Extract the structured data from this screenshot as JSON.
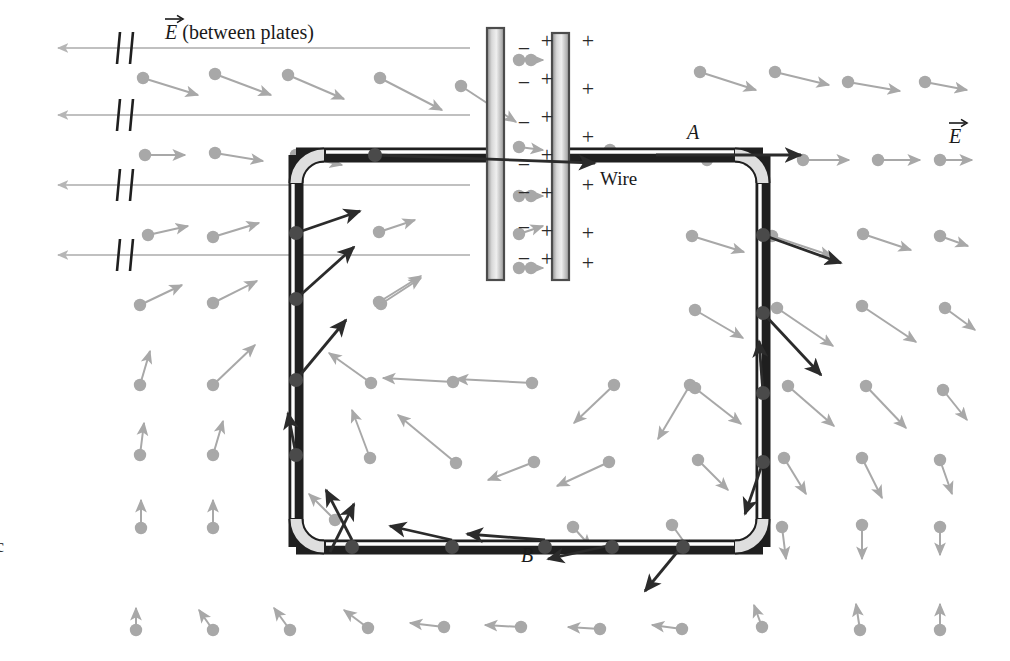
{
  "figure": {
    "domain": "physics-electrostatics-diagram",
    "title_label": "E (between plates)",
    "field_label_right": "E",
    "vector_symbol": "E",
    "labels": {
      "between_plates": "(between plates)",
      "point_a": "A",
      "point_b": "B",
      "wire": "Wire",
      "margin_char": "c"
    },
    "colors": {
      "field_gray": "#a8a8a8",
      "field_gray_light": "#c0c0c0",
      "force_dark": "#2b2b2b",
      "charge_dot": "#4a4a4a",
      "wire_outline": "#1f1f1f",
      "wire_fill_light": "#f2f2f2",
      "wire_fill_mid": "#c9c9c9",
      "plate_border": "#555555",
      "plate_fill_light": "#efefef",
      "plate_fill_dark": "#909090",
      "background": "#ffffff",
      "text": "#1a1a1a"
    },
    "plates": {
      "left": {
        "x": 487,
        "y": 28,
        "w": 17,
        "h": 252,
        "charge_symbol": "−",
        "charge_side": "right"
      },
      "right": {
        "x": 552,
        "y": 33,
        "w": 17,
        "h": 247,
        "charge_symbol": "+",
        "charge_side": "right"
      }
    },
    "minus_signs_x": 524,
    "minus_signs_y": [
      52,
      86,
      126,
      168,
      196,
      231,
      262
    ],
    "plus_inner_x": 547,
    "plus_inner_y": [
      44,
      82,
      120,
      158,
      196,
      234,
      262
    ],
    "plus_outer_x": 588,
    "plus_outer_y": [
      44,
      92,
      140,
      188,
      236,
      266
    ],
    "wire_loop": {
      "left_x": 296,
      "right_x": 763,
      "top_y": 155,
      "bottom_y": 547,
      "corner_radius": 28,
      "thickness": 13,
      "top_opening_x": 487
    },
    "wire_charges_top": [
      375
    ],
    "wire_charges_left_y": [
      233,
      299,
      380,
      455
    ],
    "wire_charges_right_y": [
      235,
      313,
      393,
      462
    ],
    "wire_charges_bottom_x": [
      352,
      452,
      545,
      612,
      683
    ],
    "field_break_lines_y": [
      48,
      115,
      185,
      255
    ],
    "break_mark_x": 120,
    "counts": {
      "background_field_vectors": 78,
      "charge_force_arrows": 16,
      "minus_signs": 7,
      "plus_signs_inner": 7,
      "plus_signs_outer": 6,
      "long_field_lines": 4
    }
  },
  "chart_data": {
    "type": "scatter",
    "xlabel": "",
    "ylabel": "",
    "background_vectors": [
      {
        "x": 143,
        "y": 78,
        "dx": 55,
        "dy": 17
      },
      {
        "x": 215,
        "y": 74,
        "dx": 56,
        "dy": 21
      },
      {
        "x": 288,
        "y": 75,
        "dx": 56,
        "dy": 24
      },
      {
        "x": 380,
        "y": 78,
        "dx": 62,
        "dy": 32
      },
      {
        "x": 461,
        "y": 86,
        "dx": 55,
        "dy": 36
      },
      {
        "x": 700,
        "y": 72,
        "dx": 56,
        "dy": 18
      },
      {
        "x": 775,
        "y": 72,
        "dx": 54,
        "dy": 13
      },
      {
        "x": 848,
        "y": 82,
        "dx": 52,
        "dy": 9
      },
      {
        "x": 925,
        "y": 82,
        "dx": 42,
        "dy": 8
      },
      {
        "x": 145,
        "y": 155,
        "dx": 40,
        "dy": 0
      },
      {
        "x": 215,
        "y": 153,
        "dx": 48,
        "dy": 8
      },
      {
        "x": 296,
        "y": 155,
        "dx": 46,
        "dy": 10
      },
      {
        "x": 519,
        "y": 147,
        "dx": 24,
        "dy": 3
      },
      {
        "x": 707,
        "y": 160,
        "dx": 50,
        "dy": 0
      },
      {
        "x": 803,
        "y": 160,
        "dx": 46,
        "dy": 0
      },
      {
        "x": 878,
        "y": 160,
        "dx": 42,
        "dy": 0
      },
      {
        "x": 940,
        "y": 160,
        "dx": 32,
        "dy": 0
      },
      {
        "x": 148,
        "y": 235,
        "dx": 40,
        "dy": -9
      },
      {
        "x": 213,
        "y": 237,
        "dx": 46,
        "dy": -14
      },
      {
        "x": 379,
        "y": 232,
        "dx": 36,
        "dy": -12
      },
      {
        "x": 519,
        "y": 234,
        "dx": 24,
        "dy": -8
      },
      {
        "x": 692,
        "y": 236,
        "dx": 52,
        "dy": 16
      },
      {
        "x": 772,
        "y": 236,
        "dx": 60,
        "dy": 20
      },
      {
        "x": 863,
        "y": 234,
        "dx": 48,
        "dy": 16
      },
      {
        "x": 940,
        "y": 236,
        "dx": 28,
        "dy": 10
      },
      {
        "x": 140,
        "y": 305,
        "dx": 42,
        "dy": -20
      },
      {
        "x": 213,
        "y": 303,
        "dx": 44,
        "dy": -22
      },
      {
        "x": 379,
        "y": 302,
        "dx": 42,
        "dy": -26
      },
      {
        "x": 695,
        "y": 310,
        "dx": 48,
        "dy": 28
      },
      {
        "x": 777,
        "y": 308,
        "dx": 56,
        "dy": 38
      },
      {
        "x": 862,
        "y": 306,
        "dx": 54,
        "dy": 36
      },
      {
        "x": 945,
        "y": 308,
        "dx": 30,
        "dy": 22
      },
      {
        "x": 140,
        "y": 385,
        "dx": 10,
        "dy": -34
      },
      {
        "x": 213,
        "y": 385,
        "dx": 42,
        "dy": -40
      },
      {
        "x": 371,
        "y": 383,
        "dx": -42,
        "dy": -30
      },
      {
        "x": 453,
        "y": 382,
        "dx": -70,
        "dy": -4
      },
      {
        "x": 532,
        "y": 383,
        "dx": -76,
        "dy": -4
      },
      {
        "x": 614,
        "y": 385,
        "dx": -40,
        "dy": 38
      },
      {
        "x": 690,
        "y": 385,
        "dx": -32,
        "dy": 54
      },
      {
        "x": 695,
        "y": 388,
        "dx": 46,
        "dy": 36
      },
      {
        "x": 788,
        "y": 386,
        "dx": 46,
        "dy": 40
      },
      {
        "x": 866,
        "y": 386,
        "dx": 40,
        "dy": 42
      },
      {
        "x": 943,
        "y": 390,
        "dx": 24,
        "dy": 30
      },
      {
        "x": 140,
        "y": 455,
        "dx": 4,
        "dy": -32
      },
      {
        "x": 213,
        "y": 455,
        "dx": 10,
        "dy": -34
      },
      {
        "x": 370,
        "y": 458,
        "dx": -18,
        "dy": -48
      },
      {
        "x": 456,
        "y": 463,
        "dx": -58,
        "dy": -48
      },
      {
        "x": 534,
        "y": 462,
        "dx": -46,
        "dy": 18
      },
      {
        "x": 609,
        "y": 462,
        "dx": -52,
        "dy": 24
      },
      {
        "x": 698,
        "y": 460,
        "dx": 30,
        "dy": 30
      },
      {
        "x": 784,
        "y": 458,
        "dx": 22,
        "dy": 36
      },
      {
        "x": 862,
        "y": 458,
        "dx": 20,
        "dy": 40
      },
      {
        "x": 940,
        "y": 460,
        "dx": 12,
        "dy": 34
      },
      {
        "x": 141,
        "y": 528,
        "dx": 0,
        "dy": -28
      },
      {
        "x": 213,
        "y": 528,
        "dx": 0,
        "dy": -28
      },
      {
        "x": 335,
        "y": 520,
        "dx": -26,
        "dy": -26
      },
      {
        "x": 573,
        "y": 527,
        "dx": 18,
        "dy": 20
      },
      {
        "x": 672,
        "y": 525,
        "dx": 20,
        "dy": 28
      },
      {
        "x": 782,
        "y": 527,
        "dx": 4,
        "dy": 32
      },
      {
        "x": 862,
        "y": 525,
        "dx": 0,
        "dy": 34
      },
      {
        "x": 940,
        "y": 527,
        "dx": 0,
        "dy": 28
      },
      {
        "x": 136,
        "y": 630,
        "dx": 0,
        "dy": -22
      },
      {
        "x": 213,
        "y": 630,
        "dx": -14,
        "dy": -20
      },
      {
        "x": 290,
        "y": 630,
        "dx": -16,
        "dy": -22
      },
      {
        "x": 368,
        "y": 628,
        "dx": -24,
        "dy": -18
      },
      {
        "x": 444,
        "y": 627,
        "dx": -34,
        "dy": -4
      },
      {
        "x": 521,
        "y": 627,
        "dx": -36,
        "dy": -2
      },
      {
        "x": 600,
        "y": 629,
        "dx": -32,
        "dy": -2
      },
      {
        "x": 682,
        "y": 629,
        "dx": -30,
        "dy": -4
      },
      {
        "x": 762,
        "y": 627,
        "dx": -8,
        "dy": -22
      },
      {
        "x": 860,
        "y": 630,
        "dx": -4,
        "dy": -26
      },
      {
        "x": 940,
        "y": 630,
        "dx": 0,
        "dy": -26
      },
      {
        "x": 610,
        "y": 150,
        "dx": 0,
        "dy": 0
      },
      {
        "x": 519,
        "y": 60,
        "dx": 24,
        "dy": 0
      },
      {
        "x": 519,
        "y": 196,
        "dx": 24,
        "dy": 0
      },
      {
        "x": 519,
        "y": 268,
        "dx": 24,
        "dy": 0
      },
      {
        "x": 381,
        "y": 304,
        "dx": 40,
        "dy": -26
      }
    ],
    "force_arrows": [
      {
        "x": 375,
        "y": 155,
        "dx": 220,
        "dy": 8
      },
      {
        "x": 656,
        "y": 155,
        "dx": 145,
        "dy": 0
      },
      {
        "x": 296,
        "y": 233,
        "dx": 64,
        "dy": -22
      },
      {
        "x": 296,
        "y": 299,
        "dx": 58,
        "dy": -52
      },
      {
        "x": 296,
        "y": 380,
        "dx": 50,
        "dy": -60
      },
      {
        "x": 296,
        "y": 455,
        "dx": -8,
        "dy": -42
      },
      {
        "x": 763,
        "y": 235,
        "dx": 78,
        "dy": 28
      },
      {
        "x": 763,
        "y": 313,
        "dx": 58,
        "dy": 62
      },
      {
        "x": 763,
        "y": 393,
        "dx": -4,
        "dy": -52
      },
      {
        "x": 763,
        "y": 462,
        "dx": -18,
        "dy": 52
      },
      {
        "x": 352,
        "y": 540,
        "dx": -26,
        "dy": -50
      },
      {
        "x": 452,
        "y": 540,
        "dx": -62,
        "dy": -14
      },
      {
        "x": 545,
        "y": 540,
        "dx": -78,
        "dy": -6
      },
      {
        "x": 612,
        "y": 545,
        "dx": -64,
        "dy": 14
      },
      {
        "x": 683,
        "y": 545,
        "dx": -38,
        "dy": 46
      },
      {
        "x": 330,
        "y": 552,
        "dx": 24,
        "dy": -48
      }
    ],
    "long_field_lines": [
      {
        "y": 48,
        "x_start": 470,
        "x_end": 58
      },
      {
        "y": 115,
        "x_start": 470,
        "x_end": 58
      },
      {
        "y": 185,
        "x_start": 470,
        "x_end": 58
      },
      {
        "y": 255,
        "x_start": 470,
        "x_end": 58
      }
    ],
    "charge_dots_gray_on_lines": [
      {
        "x": 531,
        "y": 60
      },
      {
        "x": 531,
        "y": 196
      },
      {
        "x": 531,
        "y": 268
      }
    ]
  }
}
